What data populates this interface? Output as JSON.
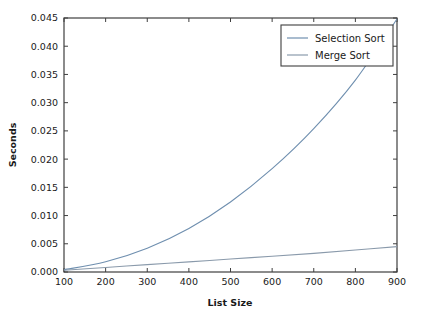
{
  "chart_data": {
    "type": "line",
    "title": "",
    "xlabel": "List Size",
    "ylabel": "Seconds",
    "xlim": [
      100,
      900
    ],
    "ylim": [
      0.0,
      0.045
    ],
    "grid": false,
    "legend_position": "upper right",
    "x": [
      100,
      200,
      300,
      400,
      500,
      600,
      700,
      800,
      900
    ],
    "xticks": [
      "100",
      "200",
      "300",
      "400",
      "500",
      "600",
      "700",
      "800",
      "900"
    ],
    "yticks": [
      "0.000",
      "0.005",
      "0.010",
      "0.015",
      "0.020",
      "0.025",
      "0.030",
      "0.035",
      "0.040",
      "0.045"
    ],
    "series": [
      {
        "name": "Selection Sort",
        "color": "#6f8faf",
        "values": [
          0.0004,
          0.0018,
          0.0042,
          0.0077,
          0.0124,
          0.0183,
          0.0254,
          0.034,
          0.0448
        ]
      },
      {
        "name": "Merge Sort",
        "color": "#8a9aab",
        "values": [
          0.0003,
          0.0008,
          0.0013,
          0.0018,
          0.0023,
          0.0028,
          0.0033,
          0.0039,
          0.0045
        ]
      }
    ]
  },
  "axes": {
    "x_axis_label": "List Size",
    "y_axis_label": "Seconds"
  },
  "legend": {
    "entries": [
      {
        "label": "Selection Sort"
      },
      {
        "label": "Merge Sort"
      }
    ]
  }
}
